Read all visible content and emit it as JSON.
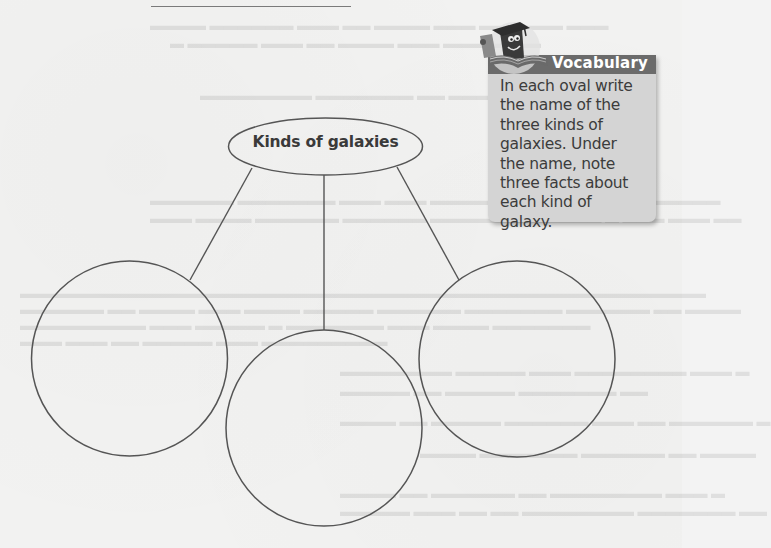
{
  "page": {
    "top_rule": "",
    "background_color": "#f2f2f1"
  },
  "organizer": {
    "central_oval": {
      "label": "Kinds of galaxies"
    },
    "branch_ovals": [
      {
        "position": "left",
        "value": ""
      },
      {
        "position": "center",
        "value": ""
      },
      {
        "position": "right",
        "value": ""
      }
    ],
    "stroke_color": "#555555"
  },
  "vocabulary": {
    "title": "Vocabulary",
    "instructions": "In each oval write the name of the three kinds of galaxies. Under the name, note three facts about each kind of galaxy.",
    "lines": [
      "In each oval write",
      "the name of the",
      "three kinds of",
      "galaxies. Under",
      "the name, note",
      "three facts about",
      "each kind of",
      "galaxy."
    ],
    "mascot_icon": "book-mascot-graduation-cap-icon",
    "header_color": "#6b6b6b",
    "box_color": "#d4d4d4"
  }
}
